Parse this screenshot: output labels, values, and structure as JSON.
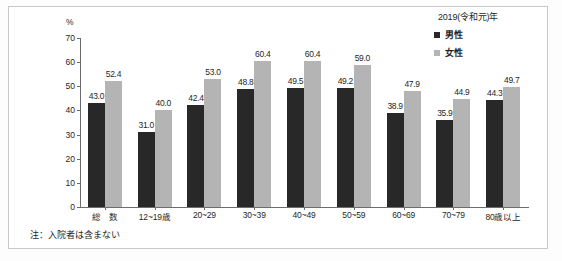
{
  "legend": {
    "title": "2019(令和元)年",
    "entries": [
      {
        "label": "男性",
        "color": "#282828",
        "icon": "square-marker-icon"
      },
      {
        "label": "女性",
        "color": "#b4b4b4",
        "icon": "square-marker-icon"
      }
    ]
  },
  "axis": {
    "unit_label": "%",
    "yticks": [
      "0",
      "10",
      "20",
      "30",
      "40",
      "50",
      "60",
      "70"
    ]
  },
  "note": "注：入院者は含まない",
  "chart_data": {
    "type": "bar",
    "title": "",
    "subtitle": "",
    "xlabel": "",
    "ylabel": "%",
    "ylim": [
      0,
      70
    ],
    "ytick_step": 10,
    "grid": false,
    "legend_position": "top-right",
    "legend_title": "2019(令和元)年",
    "annotation": "注：入院者は含まない",
    "categories": [
      "総　数",
      "12~19歳",
      "20~29",
      "30~39",
      "40~49",
      "50~59",
      "60~69",
      "70~79",
      "80歳以上"
    ],
    "series": [
      {
        "name": "男性",
        "color": "#282828",
        "values": [
          43.0,
          31.0,
          42.4,
          48.8,
          49.5,
          49.2,
          38.9,
          35.9,
          44.3
        ],
        "labels": [
          "43.0",
          "31.0",
          "42.4",
          "48.8",
          "49.5",
          "49.2",
          "38.9",
          "35.9",
          "44.3"
        ]
      },
      {
        "name": "女性",
        "color": "#b4b4b4",
        "values": [
          52.4,
          40.0,
          53.0,
          60.4,
          60.4,
          59.0,
          47.9,
          44.9,
          49.7
        ],
        "labels": [
          "52.4",
          "40.0",
          "53.0",
          "60.4",
          "60.4",
          "59.0",
          "47.9",
          "44.9",
          "49.7"
        ]
      }
    ]
  }
}
